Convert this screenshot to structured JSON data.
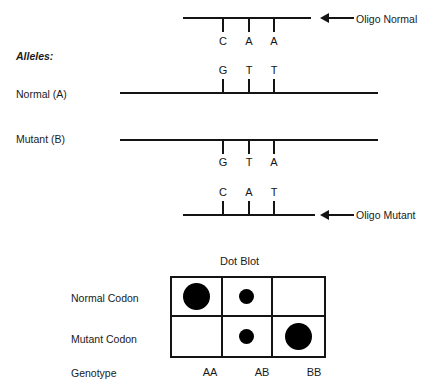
{
  "figure": {
    "section_label": "Alleles:"
  },
  "strands": [
    {
      "id": "oligo-normal",
      "name": "Oligo Normal",
      "bases": [
        "C",
        "A",
        "A"
      ],
      "bases_position": "below",
      "tick_direction": "down",
      "callout": "Oligo Normal",
      "has_arrow": true
    },
    {
      "id": "allele-normal",
      "name": "Normal (A)",
      "bases": [
        "G",
        "T",
        "T"
      ],
      "bases_position": "above",
      "tick_direction": "up",
      "callout": "",
      "has_arrow": false
    },
    {
      "id": "allele-mutant",
      "name": "Mutant (B)",
      "bases": [
        "G",
        "T",
        "A"
      ],
      "bases_position": "below",
      "tick_direction": "down",
      "callout": "",
      "has_arrow": false
    },
    {
      "id": "oligo-mutant",
      "name": "Oligo Mutant",
      "bases": [
        "C",
        "A",
        "T"
      ],
      "bases_position": "above",
      "tick_direction": "up",
      "callout": "Oligo Mutant",
      "has_arrow": true
    }
  ],
  "dot_blot": {
    "title": "Dot Blot",
    "row_labels": [
      "Normal Codon",
      "Mutant Codon"
    ],
    "genotype_label": "Genotype",
    "column_labels": [
      "AA",
      "AB",
      "BB"
    ],
    "cells": [
      [
        {
          "genotype": "AA",
          "probe": "Normal Codon",
          "signal": "large"
        },
        {
          "genotype": "AB",
          "probe": "Normal Codon",
          "signal": "small"
        },
        {
          "genotype": "BB",
          "probe": "Normal Codon",
          "signal": "none"
        }
      ],
      [
        {
          "genotype": "AA",
          "probe": "Mutant Codon",
          "signal": "none"
        },
        {
          "genotype": "AB",
          "probe": "Mutant Codon",
          "signal": "small"
        },
        {
          "genotype": "BB",
          "probe": "Mutant Codon",
          "signal": "large"
        }
      ]
    ]
  },
  "colors": {
    "ink": "#141414",
    "background": "#ffffff",
    "dot": "#000000"
  }
}
